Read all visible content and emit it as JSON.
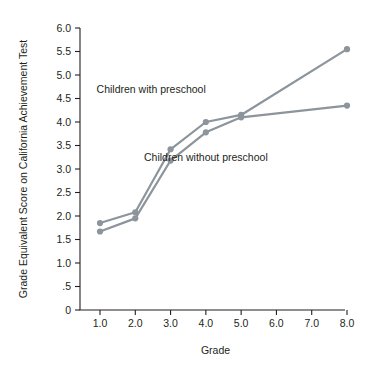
{
  "chart_data": {
    "type": "line",
    "title": "",
    "xlabel": "Grade",
    "ylabel": "Grade Equivalent Score on California Achievement Test",
    "categories": [
      "1.0",
      "2.0",
      "3.0",
      "4.0",
      "5.0",
      "6.0",
      "7.0",
      "8.0"
    ],
    "x": [
      1.0,
      2.0,
      3.0,
      4.0,
      5.0,
      8.0
    ],
    "xtick_labels": [
      "1.0",
      "2.0",
      "3.0",
      "4.0",
      "5.0",
      "6.0",
      "7.0",
      "8.0"
    ],
    "ytick_labels": [
      "0",
      ".5",
      "1.0",
      "1.5",
      "2.0",
      "2.5",
      "3.0",
      "3.5",
      "4.0",
      "4.5",
      "5.0",
      "5.5",
      "6.0"
    ],
    "ytick_values": [
      0,
      0.5,
      1.0,
      1.5,
      2.0,
      2.5,
      3.0,
      3.5,
      4.0,
      4.5,
      5.0,
      5.5,
      6.0
    ],
    "ylim": [
      0,
      6.0
    ],
    "xlim": [
      0.5,
      8.5
    ],
    "grid": false,
    "legend_position": "inline-annotations",
    "series": [
      {
        "name": "Children with preschool",
        "color": "#8c949c",
        "x": [
          1.0,
          2.0,
          3.0,
          4.0,
          5.0,
          8.0
        ],
        "values": [
          1.85,
          2.08,
          3.42,
          4.0,
          4.15,
          5.55
        ]
      },
      {
        "name": "Children without preschool",
        "color": "#8c949c",
        "x": [
          1.0,
          2.0,
          3.0,
          4.0,
          5.0,
          8.0
        ],
        "values": [
          1.67,
          1.95,
          3.18,
          3.78,
          4.1,
          4.35
        ]
      }
    ],
    "annotations": [
      {
        "text": "Children with preschool",
        "x": 2.45,
        "y": 4.62
      },
      {
        "text": "Children without preschool",
        "x": 3.95,
        "y": 3.18
      }
    ]
  }
}
